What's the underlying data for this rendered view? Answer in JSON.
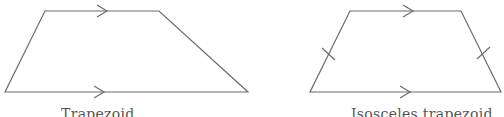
{
  "figures": [
    {
      "name": "trapezoid",
      "label": "Trapezoid",
      "vertices": {
        "top_left": [
          45,
          11
        ],
        "top_right": [
          159,
          11
        ],
        "bottom_right": [
          248,
          92
        ],
        "bottom_left": [
          5,
          92
        ]
      },
      "parallel_marks": [
        "top",
        "bottom"
      ],
      "congruent_marks": []
    },
    {
      "name": "isosceles-trapezoid",
      "label": "Isosceles trapezoid",
      "vertices": {
        "top_left": [
          350,
          11
        ],
        "top_right": [
          461,
          11
        ],
        "bottom_right": [
          501,
          92
        ],
        "bottom_left": [
          310,
          92
        ]
      },
      "parallel_marks": [
        "top",
        "bottom"
      ],
      "congruent_marks": [
        "left",
        "right"
      ]
    }
  ],
  "colors": {
    "stroke": "#6b6b6b",
    "text": "#555555"
  }
}
